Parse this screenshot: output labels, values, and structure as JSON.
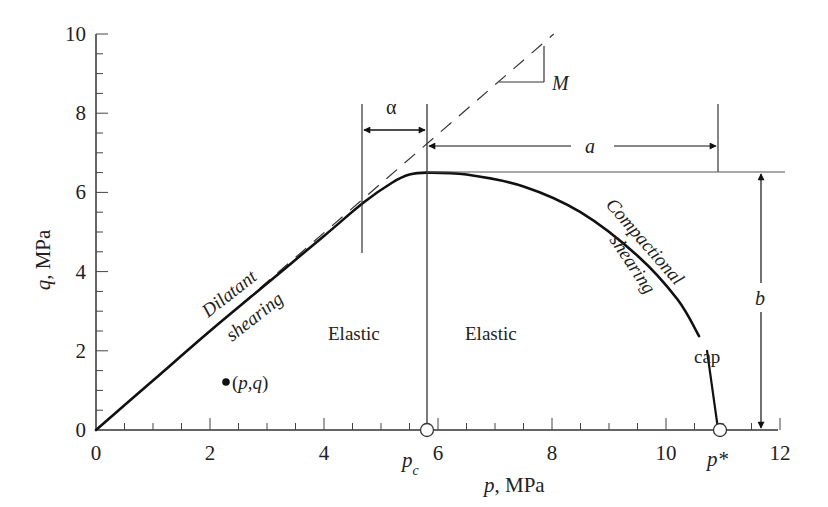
{
  "chart_data": {
    "type": "line",
    "title": "",
    "xlabel": "p, MPa",
    "ylabel": "q, MPa",
    "xlim": [
      0,
      12
    ],
    "ylim": [
      0,
      10
    ],
    "x_ticks": [
      0,
      2,
      4,
      6,
      8,
      10,
      12
    ],
    "y_ticks": [
      0,
      2,
      4,
      6,
      8,
      10
    ],
    "minor_tick_step": 0.5,
    "grid": false,
    "series": [
      {
        "name": "Yield surface (dilatant shearing + compactional shearing)",
        "style": "solid",
        "points": [
          [
            0,
            0
          ],
          [
            1,
            1.25
          ],
          [
            2,
            2.5
          ],
          [
            3,
            3.7
          ],
          [
            4,
            4.9
          ],
          [
            4.7,
            5.75
          ],
          [
            5.2,
            6.25
          ],
          [
            5.5,
            6.45
          ],
          [
            5.8,
            6.5
          ],
          [
            6.5,
            6.45
          ],
          [
            7.5,
            6.15
          ],
          [
            8.5,
            5.5
          ],
          [
            9.5,
            4.4
          ],
          [
            10.2,
            3.3
          ],
          [
            10.58,
            2.37
          ]
        ]
      },
      {
        "name": "Cap",
        "style": "solid",
        "points": [
          [
            10.72,
            2.0
          ],
          [
            10.9,
            0
          ]
        ]
      },
      {
        "name": "Critical state line (slope M)",
        "style": "dashed",
        "points": [
          [
            0,
            0
          ],
          [
            8.03,
            10
          ]
        ]
      }
    ],
    "markers": [
      {
        "label": "(p,q)",
        "p": 2.28,
        "q": 1.21,
        "style": "filled"
      },
      {
        "label": "p_c",
        "p": 5.8,
        "q": 0,
        "style": "open"
      },
      {
        "label": "p*",
        "p": 10.9,
        "q": 0,
        "style": "open"
      }
    ],
    "annotations": {
      "slope": "M",
      "alpha": "α",
      "a": "a",
      "b": "b",
      "dilatant_1": "Dilatant",
      "dilatant_2": "shearing",
      "compactional_1": "Compactional",
      "compactional_2": "shearing",
      "elastic_left": "Elastic",
      "elastic_right": "Elastic",
      "cap": "cap",
      "pc_main": "p",
      "pc_sub": "c",
      "pstar": "p*",
      "pq": "(p,q)",
      "xlabel_var": "p",
      "xlabel_unit": ", MPa",
      "ylabel_var": "q",
      "ylabel_unit": ", MPa"
    },
    "peak": {
      "p": 5.8,
      "q": 6.5
    },
    "alpha_range": [
      4.7,
      5.8
    ],
    "a_range": [
      5.8,
      10.9
    ],
    "b_range": [
      0,
      6.5
    ]
  }
}
